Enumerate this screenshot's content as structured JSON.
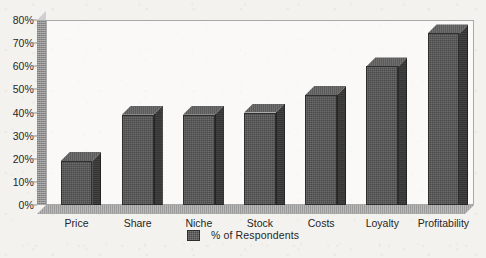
{
  "chart_data": {
    "type": "bar",
    "title": "",
    "subtitle": "",
    "xlabel": "",
    "ylabel": "",
    "categories": [
      "Price",
      "Share",
      "Niche",
      "Stock",
      "Costs",
      "Loyalty",
      "Profitability"
    ],
    "values": [
      20,
      41,
      41,
      42,
      50,
      63,
      78
    ],
    "series": [
      {
        "name": "% of Respondents",
        "values": [
          20,
          41,
          41,
          42,
          50,
          63,
          78
        ]
      }
    ],
    "ylim": [
      0,
      80
    ],
    "ytick_values": [
      0,
      10,
      20,
      30,
      40,
      50,
      60,
      70,
      80
    ],
    "ytick_labels": [
      "0%",
      "10%",
      "20%",
      "30%",
      "40%",
      "50%",
      "60%",
      "70%",
      "80%"
    ],
    "grid": false,
    "style": "3d-column",
    "legend": {
      "position": "bottom-center",
      "entries": [
        {
          "label": "% of Respondents",
          "color": "#4a4a4a"
        }
      ]
    },
    "colors": {
      "bar_front": "#4a4a4a",
      "bar_side": "#343434",
      "bar_top": "#5b5b5b",
      "plot_border": "#a9a9a9",
      "axis_wall": "#8e8e8e",
      "floor": "#9c9c9c",
      "background": "#f4f2ee",
      "text": "#262626"
    }
  }
}
